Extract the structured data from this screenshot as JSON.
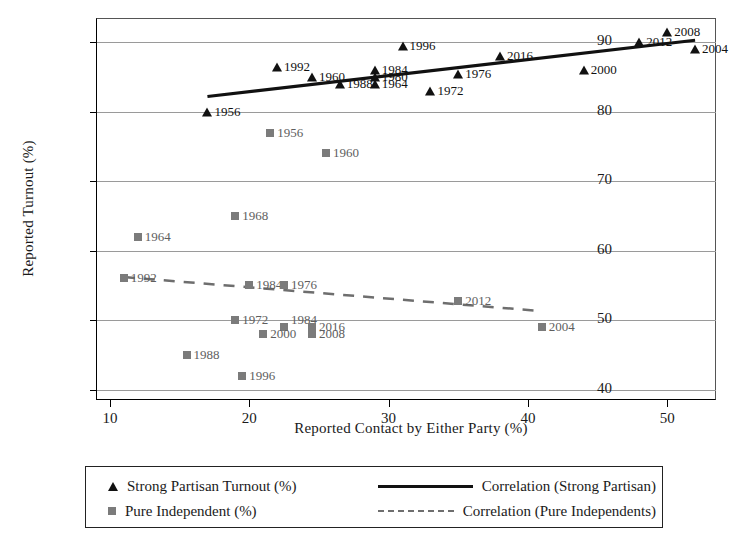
{
  "chart_data": {
    "type": "scatter",
    "title": "",
    "xlabel": "Reported Contact by Either Party (%)",
    "ylabel": "Reported Turnout (%)",
    "xlim": [
      9,
      53.5
    ],
    "ylim": [
      38.5,
      93.5
    ],
    "xticks": [
      10,
      20,
      30,
      40,
      50
    ],
    "yticks": [
      40,
      50,
      60,
      70,
      80,
      90
    ],
    "grid": "horizontal",
    "legend_position": "below-plot",
    "series": [
      {
        "name": "Strong Partisan Turnout (%)",
        "marker": "triangle",
        "color": "#111111",
        "points": [
          {
            "label": "1956",
            "x": 17.0,
            "y": 80.0,
            "label_side": "right"
          },
          {
            "label": "1992",
            "x": 22.0,
            "y": 86.5,
            "label_side": "right"
          },
          {
            "label": "1960",
            "x": 24.5,
            "y": 85.0,
            "label_side": "right"
          },
          {
            "label": "1988",
            "x": 26.5,
            "y": 84.0,
            "label_side": "right"
          },
          {
            "label": "1996",
            "x": 31.0,
            "y": 89.5,
            "label_side": "right"
          },
          {
            "label": "1984",
            "x": 29.0,
            "y": 86.0,
            "label_side": "right"
          },
          {
            "label": "1980",
            "x": 29.0,
            "y": 85.0,
            "label_side": "right"
          },
          {
            "label": "1964",
            "x": 29.0,
            "y": 84.0,
            "label_side": "right"
          },
          {
            "label": "1972",
            "x": 33.0,
            "y": 83.0,
            "label_side": "right"
          },
          {
            "label": "1976",
            "x": 35.0,
            "y": 85.5,
            "label_side": "right"
          },
          {
            "label": "2016",
            "x": 38.0,
            "y": 88.0,
            "label_side": "right"
          },
          {
            "label": "2000",
            "x": 44.0,
            "y": 86.0,
            "label_side": "right"
          },
          {
            "label": "2012",
            "x": 48.0,
            "y": 90.0,
            "label_side": "right"
          },
          {
            "label": "2008",
            "x": 50.0,
            "y": 91.5,
            "label_side": "right"
          },
          {
            "label": "2004",
            "x": 52.0,
            "y": 89.0,
            "label_side": "right"
          }
        ],
        "trend": {
          "x1": 17.0,
          "y1": 82.2,
          "x2": 52.0,
          "y2": 90.3,
          "style": "solid"
        }
      },
      {
        "name": "Pure Independent (%)",
        "marker": "square",
        "color": "#7b7b7b",
        "points": [
          {
            "label": "1956",
            "x": 21.5,
            "y": 77.0,
            "label_side": "right"
          },
          {
            "label": "1960",
            "x": 25.5,
            "y": 74.0,
            "label_side": "right"
          },
          {
            "label": "1968",
            "x": 19.0,
            "y": 65.0,
            "label_side": "right"
          },
          {
            "label": "1964",
            "x": 12.0,
            "y": 62.0,
            "label_side": "right"
          },
          {
            "label": "1992",
            "x": 11.0,
            "y": 56.0,
            "label_side": "right"
          },
          {
            "label": "1984",
            "x": 20.0,
            "y": 55.0,
            "label_side": "right"
          },
          {
            "label": "1976",
            "x": 22.5,
            "y": 55.0,
            "label_side": "right"
          },
          {
            "label": "1972",
            "x": 19.0,
            "y": 50.0,
            "label_side": "right"
          },
          {
            "label": "1984",
            "x": 22.5,
            "y": 49.0,
            "label_side": "right-above"
          },
          {
            "label": "2000",
            "x": 21.0,
            "y": 48.0,
            "label_side": "right"
          },
          {
            "label": "2016",
            "x": 24.5,
            "y": 49.0,
            "label_side": "right"
          },
          {
            "label": "2008",
            "x": 24.5,
            "y": 48.0,
            "label_side": "right"
          },
          {
            "label": "2012",
            "x": 35.0,
            "y": 52.7,
            "label_side": "right"
          },
          {
            "label": "2004",
            "x": 41.0,
            "y": 49.0,
            "label_side": "right"
          },
          {
            "label": "1988",
            "x": 15.5,
            "y": 45.0,
            "label_side": "right"
          },
          {
            "label": "1996",
            "x": 19.5,
            "y": 42.0,
            "label_side": "right"
          }
        ],
        "trend": {
          "x1": 11.0,
          "y1": 56.2,
          "x2": 41.0,
          "y2": 51.3,
          "style": "dashed"
        }
      }
    ]
  },
  "legend": {
    "entries": [
      {
        "marker": "triangle",
        "label": "Strong Partisan Turnout (%)"
      },
      {
        "marker": "square",
        "label": "Pure Independent (%)"
      }
    ],
    "lines": [
      {
        "style": "solid",
        "label": "Correlation (Strong Partisan)"
      },
      {
        "style": "dashed",
        "label": "Correlation (Pure Independents)"
      }
    ]
  }
}
